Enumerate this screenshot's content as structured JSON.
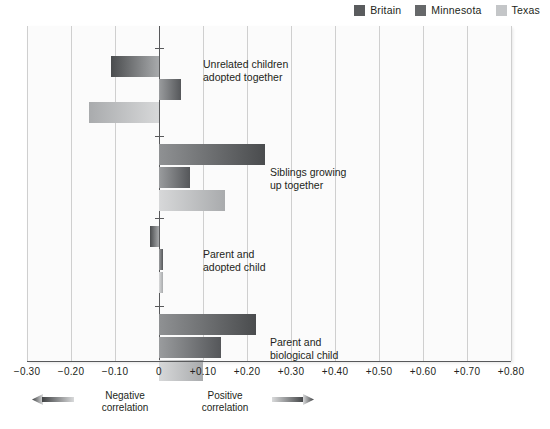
{
  "legend": {
    "items": [
      {
        "label": "Britain",
        "color": "#5a5c5e",
        "icon": "legend-swatch"
      },
      {
        "label": "Minnesota",
        "color": "#66686a",
        "icon": "legend-swatch"
      },
      {
        "label": "Texas",
        "color": "#c4c6c8",
        "icon": "legend-swatch"
      }
    ]
  },
  "axis": {
    "tick_labels": [
      "−0.30",
      "−0.20",
      "−0.10",
      "0",
      "+0.10",
      "+0.20",
      "+0.30",
      "+0.40",
      "+0.50",
      "+0.60",
      "+0.70",
      "+0.80"
    ],
    "tick_values": [
      -0.3,
      -0.2,
      -0.1,
      0,
      0.1,
      0.2,
      0.3,
      0.4,
      0.5,
      0.6,
      0.7,
      0.8
    ]
  },
  "captions": {
    "negative": "Negative\ncorrelation",
    "positive": "Positive\ncorrelation",
    "negative_arrow_icon": "arrow-left-icon",
    "positive_arrow_icon": "arrow-right-icon"
  },
  "groups": [
    {
      "label": "Unrelated children\nadopted together"
    },
    {
      "label": "Siblings growing\nup together"
    },
    {
      "label": "Parent and\nadopted child"
    },
    {
      "label": "Parent and\nbiological child"
    }
  ],
  "chart_data": {
    "type": "bar",
    "orientation": "horizontal",
    "title": "",
    "xlabel": "",
    "ylabel": "",
    "xlim": [
      -0.3,
      0.8
    ],
    "grid": true,
    "legend_position": "top-right",
    "categories": [
      "Unrelated children adopted together",
      "Siblings growing up together",
      "Parent and adopted child",
      "Parent and biological child"
    ],
    "series": [
      {
        "name": "Britain",
        "color": "#5a5c5e",
        "values": [
          -0.11,
          0.24,
          -0.02,
          0.22
        ]
      },
      {
        "name": "Minnesota",
        "color": "#66686a",
        "values": [
          0.05,
          0.07,
          0.01,
          0.14
        ]
      },
      {
        "name": "Texas",
        "color": "#c4c6c8",
        "values": [
          -0.16,
          0.15,
          0.01,
          0.1
        ]
      }
    ],
    "xticks": [
      -0.3,
      -0.2,
      -0.1,
      0,
      0.1,
      0.2,
      0.3,
      0.4,
      0.5,
      0.6,
      0.7,
      0.8
    ],
    "xtick_labels": [
      "−0.30",
      "−0.20",
      "−0.10",
      "0",
      "+0.10",
      "+0.20",
      "+0.30",
      "+0.40",
      "+0.50",
      "+0.60",
      "+0.70",
      "+0.80"
    ],
    "annotations": [
      "Negative correlation",
      "Positive correlation"
    ]
  }
}
